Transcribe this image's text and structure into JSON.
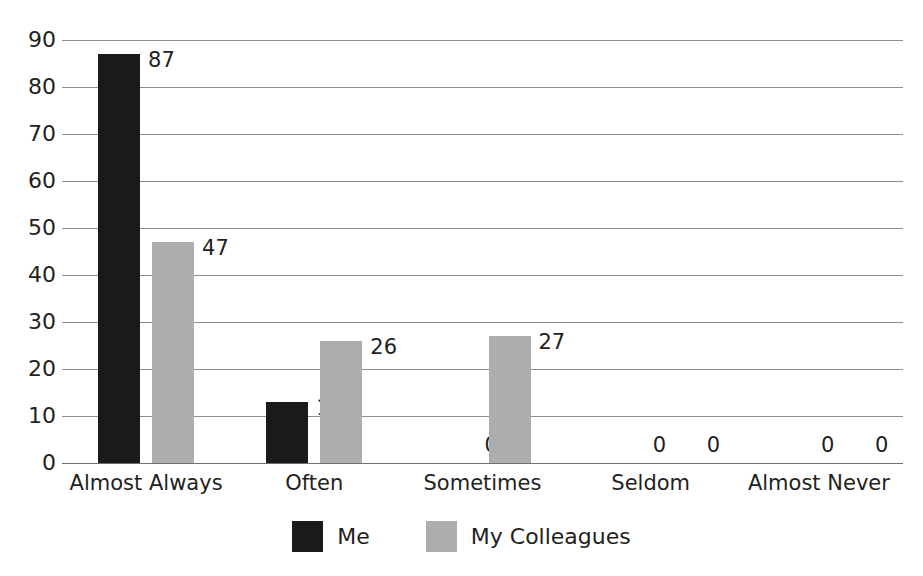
{
  "chart_data": {
    "type": "bar",
    "title": "",
    "title_visible": false,
    "title_note": "clipped-off-top-edge",
    "xlabel": "",
    "ylabel": "",
    "ylim": [
      0,
      90
    ],
    "ytick_step": 10,
    "yticks": [
      "90",
      "80",
      "70",
      "60",
      "50",
      "40",
      "30",
      "20",
      "10",
      "0"
    ],
    "grid": true,
    "grid_axis": "y",
    "legend_position": "bottom-center",
    "categories": [
      "Almost Always",
      "Often",
      "Sometimes",
      "Seldom",
      "Almost Never"
    ],
    "series": [
      {
        "name": "Me",
        "color": "#1a1a1a",
        "values": [
          87,
          13,
          0,
          0,
          0
        ],
        "labels": [
          "87",
          "13",
          "0",
          "0",
          "0"
        ]
      },
      {
        "name": "My Colleagues",
        "color": "#adadad",
        "values": [
          47,
          26,
          27,
          0,
          0
        ],
        "labels": [
          "47",
          "26",
          "27",
          "0",
          "0"
        ]
      }
    ]
  },
  "colors": {
    "series_me": "#1a1a1a",
    "series_colleagues": "#adadad",
    "gridline": "#8d8d8d",
    "axis": "#6f6f6f",
    "text": "#231f20",
    "background": "#ffffff"
  },
  "legend": {
    "items": [
      {
        "label": "Me",
        "swatch": "#1a1a1a"
      },
      {
        "label": "My Colleagues",
        "swatch": "#adadad"
      }
    ]
  }
}
